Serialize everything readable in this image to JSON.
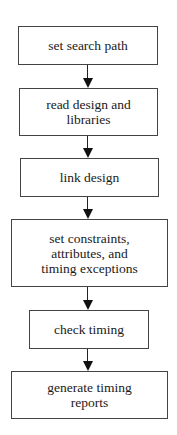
{
  "diagram": {
    "type": "flowchart",
    "direction": "top-to-bottom",
    "steps": [
      {
        "id": "step1",
        "label": "set search path",
        "lines": [
          "set search path"
        ]
      },
      {
        "id": "step2",
        "label": "read design and libraries",
        "lines": [
          "read design and",
          "libraries"
        ]
      },
      {
        "id": "step3",
        "label": "link design",
        "lines": [
          "link design"
        ]
      },
      {
        "id": "step4",
        "label": "set constraints, attributes, and timing exceptions",
        "lines": [
          "set constraints,",
          "attributes, and",
          "timing exceptions"
        ]
      },
      {
        "id": "step5",
        "label": "check timing",
        "lines": [
          "check timing"
        ]
      },
      {
        "id": "step6",
        "label": "generate timing reports",
        "lines": [
          "generate timing",
          "reports"
        ]
      }
    ],
    "edges": [
      {
        "from": "step1",
        "to": "step2"
      },
      {
        "from": "step2",
        "to": "step3"
      },
      {
        "from": "step3",
        "to": "step4"
      },
      {
        "from": "step4",
        "to": "step5"
      },
      {
        "from": "step5",
        "to": "step6"
      }
    ],
    "colors": {
      "border": "#444444",
      "arrow": "#111111",
      "text": "#1a1a1a",
      "background": "#ffffff"
    }
  }
}
